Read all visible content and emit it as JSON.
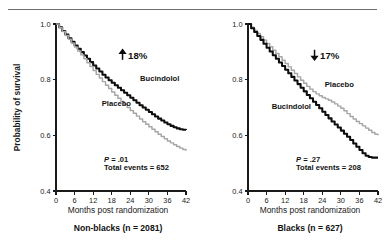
{
  "figure": {
    "rule_color": "#6f6f6f",
    "treat_color": "#0d0d0d",
    "ctrl_color": "#a6a6a6"
  },
  "chart_data": [
    {
      "type": "line",
      "title": "Non-blacks (n = 2081)",
      "xlabel": "Months post randomization",
      "ylabel": "Probability of survival",
      "xlim": [
        0,
        42
      ],
      "ylim": [
        0.4,
        1.0
      ],
      "xticks": [
        0,
        6,
        12,
        18,
        24,
        30,
        36,
        42
      ],
      "xticklabels": [
        "0",
        "6",
        "12",
        "18",
        "24",
        "30",
        "36",
        "42"
      ],
      "yticks": [
        0.4,
        0.6,
        0.8,
        1.0
      ],
      "yticklabels": [
        "0.4",
        "0.6",
        "0.8",
        "1.0"
      ],
      "grid": false,
      "legend_position": "inline-annotation",
      "annotations": {
        "effect_arrow": "up",
        "effect_value": "18%",
        "p_value": "P = .01",
        "total_events": "Total events = 652"
      },
      "series": [
        {
          "name": "Bucindolol",
          "style": "solid-black",
          "label_x": 33.5,
          "label_y": 0.795,
          "x": [
            0,
            1,
            2,
            3,
            4,
            5,
            6,
            7,
            8,
            9,
            10,
            11,
            12,
            13,
            14,
            15,
            16,
            17,
            18,
            19,
            20,
            21,
            22,
            23,
            24,
            25,
            26,
            27,
            28,
            29,
            30,
            31,
            32,
            33,
            34,
            35,
            36,
            37,
            38,
            39,
            40,
            41,
            42
          ],
          "y": [
            1.0,
            0.988,
            0.975,
            0.962,
            0.949,
            0.936,
            0.923,
            0.911,
            0.899,
            0.887,
            0.875,
            0.863,
            0.851,
            0.84,
            0.829,
            0.818,
            0.808,
            0.798,
            0.789,
            0.78,
            0.771,
            0.762,
            0.753,
            0.744,
            0.735,
            0.726,
            0.717,
            0.708,
            0.7,
            0.692,
            0.684,
            0.676,
            0.668,
            0.66,
            0.653,
            0.646,
            0.64,
            0.634,
            0.629,
            0.625,
            0.622,
            0.62,
            0.619
          ]
        },
        {
          "name": "Placebo",
          "style": "solid-gray",
          "label_x": 19.5,
          "label_y": 0.705,
          "x": [
            0,
            1,
            2,
            3,
            4,
            5,
            6,
            7,
            8,
            9,
            10,
            11,
            12,
            13,
            14,
            15,
            16,
            17,
            18,
            19,
            20,
            21,
            22,
            23,
            24,
            25,
            26,
            27,
            28,
            29,
            30,
            31,
            32,
            33,
            34,
            35,
            36,
            37,
            38,
            39,
            40,
            41,
            42
          ],
          "y": [
            1.0,
            0.987,
            0.973,
            0.959,
            0.945,
            0.931,
            0.917,
            0.903,
            0.889,
            0.875,
            0.861,
            0.847,
            0.833,
            0.819,
            0.806,
            0.793,
            0.78,
            0.768,
            0.756,
            0.744,
            0.733,
            0.722,
            0.711,
            0.7,
            0.689,
            0.679,
            0.669,
            0.659,
            0.649,
            0.64,
            0.631,
            0.622,
            0.613,
            0.604,
            0.596,
            0.588,
            0.58,
            0.573,
            0.566,
            0.56,
            0.554,
            0.549,
            0.545
          ]
        }
      ]
    },
    {
      "type": "line",
      "title": "Blacks (n = 627)",
      "xlabel": "Months post randomization",
      "ylabel": "",
      "xlim": [
        0,
        42
      ],
      "ylim": [
        0.4,
        1.0
      ],
      "xticks": [
        0,
        6,
        12,
        18,
        24,
        30,
        36,
        42
      ],
      "xticklabels": [
        "0",
        "6",
        "12",
        "18",
        "24",
        "30",
        "36",
        "42"
      ],
      "yticks": [
        0.4,
        0.6,
        0.8,
        1.0
      ],
      "yticklabels": [
        "0.4",
        "0.6",
        "0.8",
        "1.0"
      ],
      "grid": false,
      "legend_position": "inline-annotation",
      "annotations": {
        "effect_arrow": "down",
        "effect_value": "17%",
        "p_value": "P = .27",
        "total_events": "Total events = 208"
      },
      "series": [
        {
          "name": "Placebo",
          "style": "solid-gray",
          "label_x": 29.5,
          "label_y": 0.775,
          "x": [
            0,
            1,
            2,
            3,
            4,
            5,
            6,
            7,
            8,
            9,
            10,
            11,
            12,
            13,
            14,
            15,
            16,
            17,
            18,
            19,
            20,
            21,
            22,
            23,
            24,
            25,
            26,
            27,
            28,
            29,
            30,
            31,
            32,
            33,
            34,
            35,
            36,
            37,
            38,
            39,
            40,
            41,
            42
          ],
          "y": [
            1.0,
            0.988,
            0.977,
            0.966,
            0.954,
            0.942,
            0.93,
            0.918,
            0.906,
            0.894,
            0.882,
            0.87,
            0.858,
            0.846,
            0.834,
            0.822,
            0.81,
            0.798,
            0.787,
            0.776,
            0.766,
            0.757,
            0.749,
            0.742,
            0.736,
            0.731,
            0.726,
            0.72,
            0.713,
            0.705,
            0.697,
            0.688,
            0.678,
            0.668,
            0.659,
            0.65,
            0.642,
            0.634,
            0.626,
            0.618,
            0.61,
            0.604,
            0.6
          ]
        },
        {
          "name": "Bucindolol",
          "style": "solid-black",
          "label_x": 14.0,
          "label_y": 0.695,
          "x": [
            0,
            1,
            2,
            3,
            4,
            5,
            6,
            7,
            8,
            9,
            10,
            11,
            12,
            13,
            14,
            15,
            16,
            17,
            18,
            19,
            20,
            21,
            22,
            23,
            24,
            25,
            26,
            27,
            28,
            29,
            30,
            31,
            32,
            33,
            34,
            35,
            36,
            37,
            38,
            39,
            40,
            41,
            42
          ],
          "y": [
            1.0,
            0.985,
            0.971,
            0.957,
            0.943,
            0.929,
            0.915,
            0.901,
            0.888,
            0.875,
            0.862,
            0.849,
            0.836,
            0.823,
            0.81,
            0.797,
            0.784,
            0.771,
            0.758,
            0.745,
            0.733,
            0.721,
            0.709,
            0.697,
            0.685,
            0.673,
            0.661,
            0.65,
            0.639,
            0.628,
            0.617,
            0.606,
            0.595,
            0.583,
            0.571,
            0.559,
            0.547,
            0.536,
            0.527,
            0.522,
            0.52,
            0.52,
            0.52
          ]
        }
      ]
    }
  ]
}
